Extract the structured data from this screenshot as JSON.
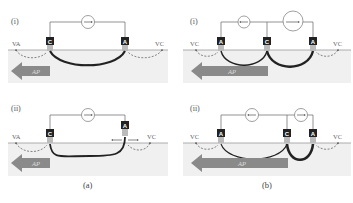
{
  "figure": {
    "panels": [
      {
        "id": "a-i",
        "label": "(i)",
        "left_label": "VA",
        "right_label": "VC",
        "electrodes": [
          "C",
          "A"
        ],
        "arrow_label": "AP"
      },
      {
        "id": "a-ii",
        "label": "(ii)",
        "left_label": "VA",
        "right_label": "VC",
        "electrodes": [
          "C",
          "A"
        ],
        "arrow_label": "AP"
      },
      {
        "id": "b-i",
        "label": "(i)",
        "left_label": "VC",
        "right_label": "VC",
        "electrodes": [
          "A",
          "C",
          "A"
        ],
        "arrow_label": "AP"
      },
      {
        "id": "b-ii",
        "label": "(ii)",
        "left_label": "VC",
        "right_label": "VC",
        "electrodes": [
          "A",
          "C",
          "A"
        ],
        "arrow_label": "AP"
      }
    ],
    "captions": {
      "a": "(a)",
      "b": "(b)"
    },
    "colors": {
      "electrode": "#222222",
      "electrode_tip": "#bbbbbb",
      "tissue": "#f0f0f0",
      "surface_line": "#999999",
      "arrow": "#8a8a8a",
      "wire": "#666666",
      "current_path": "#222222"
    }
  }
}
